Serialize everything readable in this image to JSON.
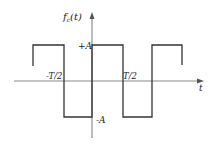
{
  "diagram": {
    "type": "square-wave",
    "y_axis_label": "f_c(t)",
    "y_axis_label_main": "f",
    "y_axis_label_sub": "c",
    "y_axis_label_arg": "(t)",
    "x_axis_label": "t",
    "levels": {
      "high": "+A",
      "low": "-A"
    },
    "x_ticks": [
      "-T/2",
      "T/2"
    ],
    "colors": {
      "line": "#333333",
      "axis": "#888888",
      "text": "#222222"
    }
  }
}
